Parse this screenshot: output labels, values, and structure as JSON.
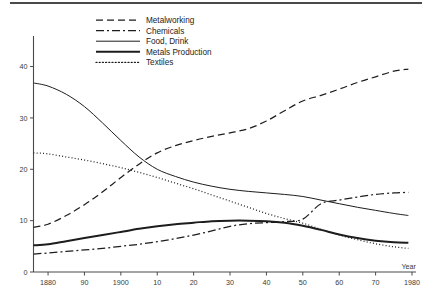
{
  "figure": {
    "background_color": "#ffffff",
    "line_color": "#1d1d1d",
    "axis_color": "#4a4a4a",
    "top_rule": "horizontal-rule"
  },
  "chart_data": {
    "type": "line",
    "title": "",
    "subtitle": "",
    "xlabel": "Year",
    "ylabel": "",
    "xlim": [
      1876,
      1980
    ],
    "ylim": [
      0,
      44
    ],
    "grid": false,
    "legend_position": "top-center",
    "x_tick_values": [
      1880,
      1890,
      1900,
      1910,
      1920,
      1930,
      1940,
      1950,
      1960,
      1970,
      1980
    ],
    "x_tick_labels": [
      "1880",
      "90",
      "1900",
      "10",
      "20",
      "30",
      "40",
      "50",
      "60",
      "70",
      "1980"
    ],
    "y_tick_values": [
      0,
      10,
      20,
      30,
      40
    ],
    "y_tick_labels": [
      "0",
      "10",
      "20",
      "30",
      "40"
    ],
    "x": [
      1876,
      1880,
      1885,
      1890,
      1895,
      1900,
      1905,
      1910,
      1915,
      1920,
      1925,
      1930,
      1935,
      1940,
      1945,
      1950,
      1955,
      1960,
      1965,
      1970,
      1975,
      1979
    ],
    "series": [
      {
        "name": "Metalworking",
        "style": "dashed",
        "dash": "7,4",
        "width": 1.25,
        "values": [
          8.7,
          9.3,
          11.0,
          13.1,
          15.6,
          18.4,
          21.0,
          23.2,
          24.6,
          25.6,
          26.4,
          27.1,
          27.9,
          29.4,
          31.4,
          33.3,
          34.4,
          35.6,
          36.9,
          38.0,
          39.1,
          39.5
        ]
      },
      {
        "name": "Chemicals",
        "style": "dash-dot",
        "dash": "8,3,2,3",
        "width": 1.25,
        "values": [
          3.5,
          3.7,
          4.0,
          4.3,
          4.6,
          5.0,
          5.4,
          5.9,
          6.5,
          7.2,
          8.0,
          8.9,
          9.4,
          9.6,
          9.8,
          10.3,
          13.3,
          14.0,
          14.6,
          15.1,
          15.4,
          15.5
        ]
      },
      {
        "name": "Food, Drink",
        "style": "solid-thin",
        "dash": "none",
        "width": 1.0,
        "values": [
          36.8,
          36.2,
          34.6,
          32.2,
          29.0,
          25.6,
          22.4,
          20.0,
          18.6,
          17.5,
          16.7,
          16.1,
          15.7,
          15.4,
          15.1,
          14.7,
          14.0,
          13.3,
          12.6,
          12.0,
          11.4,
          11.0
        ]
      },
      {
        "name": "Metals Production",
        "style": "solid-thick",
        "dash": "none",
        "width": 2.0,
        "values": [
          5.2,
          5.4,
          6.0,
          6.6,
          7.2,
          7.8,
          8.4,
          8.9,
          9.3,
          9.6,
          9.9,
          10.0,
          10.0,
          9.9,
          9.6,
          9.0,
          8.2,
          7.3,
          6.6,
          6.1,
          5.8,
          5.7
        ]
      },
      {
        "name": "Textiles",
        "style": "dotted",
        "dash": "1,2.2",
        "width": 1.25,
        "values": [
          23.2,
          23.0,
          22.4,
          21.8,
          21.1,
          20.3,
          19.4,
          18.4,
          17.3,
          16.2,
          15.0,
          13.8,
          12.6,
          11.4,
          10.4,
          9.5,
          8.3,
          7.2,
          6.3,
          5.5,
          4.9,
          4.6
        ]
      }
    ]
  },
  "legend": {
    "items": [
      {
        "label": "Metalworking"
      },
      {
        "label": "Chemicals"
      },
      {
        "label": "Food, Drink"
      },
      {
        "label": "Metals Production"
      },
      {
        "label": "Textiles"
      }
    ]
  }
}
